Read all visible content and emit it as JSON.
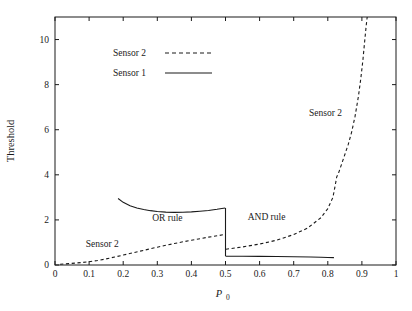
{
  "chart_data": {
    "type": "line",
    "title": "",
    "xlabel": "P_0",
    "xlabel_base": "P",
    "xlabel_sub": "0",
    "ylabel": "Threshold",
    "xlim": [
      0,
      1
    ],
    "ylim": [
      0,
      11
    ],
    "grid": false,
    "xticks": [
      0,
      0.1,
      0.2,
      0.3,
      0.4,
      0.5,
      0.6,
      0.7,
      0.8,
      0.9,
      1
    ],
    "xtick_labels": [
      "0",
      "0.1",
      "0.2",
      "0.3",
      "0.4",
      "0.5",
      "0.6",
      "0.7",
      "0.8",
      "0.9",
      "1"
    ],
    "yticks": [
      0,
      2,
      4,
      6,
      8,
      10
    ],
    "ytick_labels": [
      "0",
      "2",
      "4",
      "6",
      "8",
      "10"
    ],
    "legend": {
      "position": "upper-left-inside",
      "entries": [
        {
          "label": "Sensor 2",
          "style": "dashed"
        },
        {
          "label": "Sensor 1",
          "style": "solid"
        }
      ]
    },
    "annotations": [
      {
        "text": "Sensor 2",
        "x": 0.09,
        "y": 0.78
      },
      {
        "text": "OR rule",
        "x": 0.285,
        "y": 1.95
      },
      {
        "text": "AND rule",
        "x": 0.565,
        "y": 2.0
      },
      {
        "text": "Sensor 2",
        "x": 0.745,
        "y": 6.62
      }
    ],
    "series": [
      {
        "name": "Sensor 1",
        "style": "solid",
        "segments": [
          {
            "region": "OR rule",
            "points": [
              [
                0.185,
                2.95
              ],
              [
                0.2,
                2.78
              ],
              [
                0.22,
                2.63
              ],
              [
                0.24,
                2.53
              ],
              [
                0.26,
                2.46
              ],
              [
                0.28,
                2.41
              ],
              [
                0.3,
                2.37
              ],
              [
                0.325,
                2.345
              ],
              [
                0.35,
                2.335
              ],
              [
                0.375,
                2.34
              ],
              [
                0.4,
                2.355
              ],
              [
                0.425,
                2.385
              ],
              [
                0.45,
                2.42
              ],
              [
                0.475,
                2.47
              ],
              [
                0.499,
                2.53
              ]
            ]
          },
          {
            "region": "AND rule",
            "points": [
              [
                0.501,
                0.385
              ],
              [
                0.55,
                0.385
              ],
              [
                0.6,
                0.382
              ],
              [
                0.65,
                0.376
              ],
              [
                0.7,
                0.366
              ],
              [
                0.75,
                0.352
              ],
              [
                0.78,
                0.342
              ],
              [
                0.8,
                0.333
              ],
              [
                0.818,
                0.325
              ]
            ]
          }
        ]
      },
      {
        "name": "Sensor 2",
        "style": "dashed",
        "segments": [
          {
            "region": "OR rule",
            "points": [
              [
                0.015,
                0.03
              ],
              [
                0.04,
                0.06
              ],
              [
                0.06,
                0.085
              ],
              [
                0.08,
                0.11
              ],
              [
                0.1,
                0.145
              ],
              [
                0.125,
                0.2
              ],
              [
                0.15,
                0.27
              ],
              [
                0.175,
                0.355
              ],
              [
                0.2,
                0.44
              ],
              [
                0.25,
                0.615
              ],
              [
                0.3,
                0.79
              ],
              [
                0.35,
                0.955
              ],
              [
                0.4,
                1.1
              ],
              [
                0.45,
                1.235
              ],
              [
                0.499,
                1.355
              ]
            ]
          },
          {
            "region": "AND rule",
            "points": [
              [
                0.501,
                0.7
              ],
              [
                0.55,
                0.8
              ],
              [
                0.6,
                0.93
              ],
              [
                0.65,
                1.1
              ],
              [
                0.7,
                1.35
              ],
              [
                0.74,
                1.63
              ],
              [
                0.78,
                2.1
              ],
              [
                0.8,
                2.5
              ],
              [
                0.815,
                3.0
              ],
              [
                0.822,
                3.55
              ],
              [
                0.826,
                3.9
              ],
              [
                0.832,
                4.1
              ],
              [
                0.84,
                4.45
              ],
              [
                0.85,
                4.9
              ],
              [
                0.86,
                5.35
              ],
              [
                0.87,
                5.9
              ],
              [
                0.88,
                6.6
              ],
              [
                0.89,
                7.5
              ],
              [
                0.897,
                8.3
              ],
              [
                0.903,
                9.1
              ],
              [
                0.908,
                9.9
              ],
              [
                0.9125,
                10.6
              ],
              [
                0.9155,
                11.0
              ]
            ]
          }
        ]
      }
    ]
  }
}
